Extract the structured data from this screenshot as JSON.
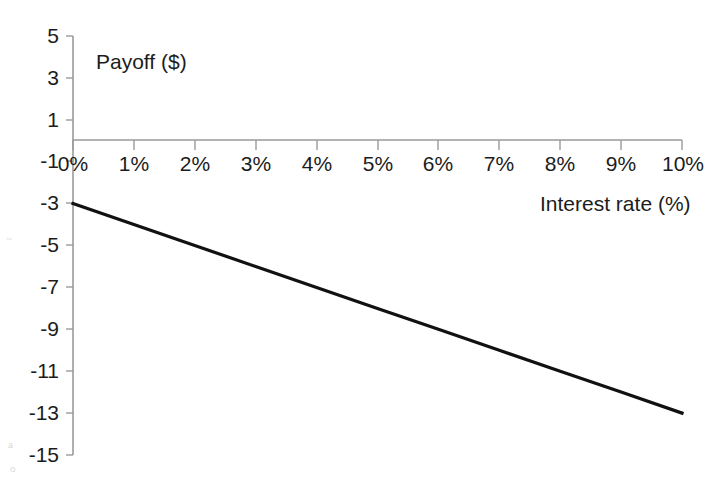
{
  "chart_data": {
    "type": "line",
    "title": "",
    "subtitle": "",
    "xlabel": "Interest rate (%)",
    "ylabel": "Payoff ($)",
    "xlim": [
      0,
      10
    ],
    "ylim": [
      -15,
      5
    ],
    "grid": false,
    "legend": false,
    "legend_position": "none",
    "x_tick_labels": [
      "0%",
      "1%",
      "2%",
      "3%",
      "4%",
      "5%",
      "6%",
      "7%",
      "8%",
      "9%",
      "10%"
    ],
    "x_tick_values": [
      0,
      1,
      2,
      3,
      4,
      5,
      6,
      7,
      8,
      9,
      10
    ],
    "y_tick_labels": [
      "5",
      "3",
      "1",
      "-1",
      "-3",
      "-5",
      "-7",
      "-9",
      "-11",
      "-13",
      "-15"
    ],
    "y_tick_values": [
      5,
      3,
      1,
      -1,
      -3,
      -5,
      -7,
      -9,
      -11,
      -13,
      -15
    ],
    "series": [
      {
        "name": "Payoff",
        "color": "#111111",
        "x": [
          0,
          1,
          2,
          3,
          4,
          5,
          6,
          7,
          8,
          9,
          10
        ],
        "values": [
          -3,
          -4,
          -5,
          -6,
          -7,
          -8,
          -9,
          -10,
          -11,
          -12,
          -13
        ]
      }
    ]
  },
  "axis_titles": {
    "y": "Payoff ($)",
    "x": "Interest rate (%)"
  },
  "colors": {
    "series": "#111111",
    "axis": "#9a9a9a",
    "text": "#1c1c1c",
    "background": "#ffffff"
  },
  "artifacts": {
    "marks": [
      "~",
      "a",
      "o"
    ]
  }
}
